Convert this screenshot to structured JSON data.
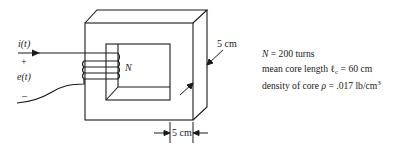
{
  "diagram": {
    "type": "magnetic-core-with-coil",
    "colors": {
      "line": "#1a1a1a",
      "background": "#ffffff"
    },
    "circuit_labels": {
      "current": "i(t)",
      "plus": "+",
      "voltage": "e(t)",
      "minus": "–",
      "turns_symbol": "N"
    },
    "dimensions": {
      "depth": "5 cm",
      "leg_width": "5 cm"
    },
    "specs": {
      "turns_symbol": "N",
      "turns_value": " = 200 turns",
      "length_prefix": "mean core length ",
      "length_symbol": "ℓ",
      "length_sub": "c",
      "length_value": " = 60 cm",
      "density_prefix": "density of core ",
      "density_symbol": "ρ",
      "density_value": " = .017 lb/cm",
      "density_exp": "3"
    }
  }
}
